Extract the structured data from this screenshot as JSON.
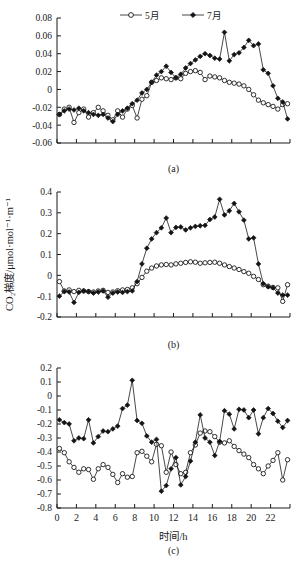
{
  "figure": {
    "xlabel": "时间/h",
    "ylabel": "CO₂梯度/μmol·mol⁻¹·m⁻¹",
    "legend": [
      {
        "label": "5月",
        "marker": "open-circle"
      },
      {
        "label": "7月",
        "marker": "filled-diamond"
      }
    ],
    "panel_labels": [
      "(a)",
      "(b)",
      "(c)"
    ]
  },
  "chart_data": [
    {
      "type": "line",
      "panel": "(a)",
      "title": "",
      "xlabel": "",
      "ylabel": "",
      "xlim": [
        0,
        24
      ],
      "ylim": [
        -0.06,
        0.08
      ],
      "yticks": [
        0.08,
        0.06,
        0.04,
        0.02,
        0,
        -0.02,
        -0.04,
        -0.06
      ],
      "ytick_labels": [
        "0.08",
        "0.06",
        "0.04",
        "0.02",
        "0",
        "-0.02",
        "-0.04",
        "-0.06"
      ],
      "xticks": [
        0,
        2,
        4,
        6,
        8,
        10,
        12,
        14,
        16,
        18,
        20,
        22
      ],
      "xtick_labels": [],
      "grid": false,
      "legend_position": "top-center",
      "x": [
        0.25,
        0.75,
        1.25,
        1.75,
        2.25,
        2.75,
        3.25,
        3.75,
        4.25,
        4.75,
        5.25,
        5.75,
        6.25,
        6.75,
        7.25,
        7.75,
        8.25,
        8.75,
        9.25,
        9.75,
        10.25,
        10.75,
        11.25,
        11.75,
        12.25,
        12.75,
        13.25,
        13.75,
        14.25,
        14.75,
        15.25,
        15.75,
        16.25,
        16.75,
        17.25,
        17.75,
        18.25,
        18.75,
        19.25,
        19.75,
        20.25,
        20.75,
        21.25,
        21.75,
        22.25,
        22.75,
        23.25,
        23.75
      ],
      "series": [
        {
          "name": "5月",
          "marker": "open-circle",
          "values": [
            -0.028,
            -0.022,
            -0.02,
            -0.037,
            -0.026,
            -0.022,
            -0.031,
            -0.026,
            -0.02,
            -0.024,
            -0.029,
            -0.034,
            -0.024,
            -0.031,
            -0.022,
            -0.018,
            -0.032,
            -0.011,
            -0.007,
            0.008,
            0.01,
            0.013,
            0.012,
            0.011,
            0.013,
            0.012,
            0.018,
            0.02,
            0.021,
            0.019,
            0.011,
            0.015,
            0.014,
            0.013,
            0.01,
            0.008,
            0.007,
            0.006,
            0.004,
            0.0,
            -0.006,
            -0.012,
            -0.015,
            -0.017,
            -0.019,
            -0.022,
            -0.017,
            -0.016
          ]
        },
        {
          "name": "7月",
          "marker": "filled-diamond",
          "values": [
            -0.028,
            -0.024,
            -0.022,
            -0.023,
            -0.021,
            -0.024,
            -0.026,
            -0.028,
            -0.029,
            -0.028,
            -0.032,
            -0.036,
            -0.028,
            -0.024,
            -0.021,
            -0.016,
            -0.012,
            -0.004,
            0.0,
            0.008,
            0.016,
            0.02,
            0.026,
            0.019,
            0.013,
            0.017,
            0.024,
            0.029,
            0.033,
            0.037,
            0.04,
            0.038,
            0.035,
            0.034,
            0.064,
            0.032,
            0.039,
            0.041,
            0.047,
            0.055,
            0.049,
            0.051,
            0.022,
            0.018,
            0.004,
            -0.01,
            -0.014,
            -0.033
          ]
        }
      ]
    },
    {
      "type": "line",
      "panel": "(b)",
      "title": "",
      "xlabel": "",
      "ylabel": "CO₂梯度/μmol·mol⁻¹·m⁻¹",
      "xlim": [
        0,
        24
      ],
      "ylim": [
        -0.2,
        0.4
      ],
      "yticks": [
        0.4,
        0.3,
        0.2,
        0.1,
        0,
        -0.1,
        -0.2
      ],
      "ytick_labels": [
        "0.4",
        "0.3",
        "0.2",
        "0.1",
        "0",
        "-0.1",
        "-0.2"
      ],
      "xticks": [
        0,
        2,
        4,
        6,
        8,
        10,
        12,
        14,
        16,
        18,
        20,
        22
      ],
      "xtick_labels": [],
      "grid": false,
      "x": [
        0.25,
        0.75,
        1.25,
        1.75,
        2.25,
        2.75,
        3.25,
        3.75,
        4.25,
        4.75,
        5.25,
        5.75,
        6.25,
        6.75,
        7.25,
        7.75,
        8.25,
        8.75,
        9.25,
        9.75,
        10.25,
        10.75,
        11.25,
        11.75,
        12.25,
        12.75,
        13.25,
        13.75,
        14.25,
        14.75,
        15.25,
        15.75,
        16.25,
        16.75,
        17.25,
        17.75,
        18.25,
        18.75,
        19.25,
        19.75,
        20.25,
        20.75,
        21.25,
        21.75,
        22.25,
        22.75,
        23.25,
        23.75
      ],
      "series": [
        {
          "name": "5月",
          "marker": "open-circle",
          "values": [
            -0.03,
            -0.075,
            -0.07,
            -0.078,
            -0.072,
            -0.075,
            -0.078,
            -0.08,
            -0.075,
            -0.072,
            -0.082,
            -0.08,
            -0.074,
            -0.07,
            -0.068,
            -0.06,
            -0.04,
            -0.01,
            0.02,
            0.035,
            0.045,
            0.05,
            0.052,
            0.05,
            0.055,
            0.058,
            0.062,
            0.065,
            0.063,
            0.058,
            0.06,
            0.062,
            0.063,
            0.058,
            0.05,
            0.042,
            0.035,
            0.028,
            0.018,
            0.01,
            -0.005,
            -0.02,
            -0.045,
            -0.052,
            -0.058,
            -0.06,
            -0.125,
            -0.045
          ]
        },
        {
          "name": "7月",
          "marker": "filled-diamond",
          "values": [
            -0.1,
            -0.078,
            -0.08,
            -0.13,
            -0.082,
            -0.075,
            -0.078,
            -0.085,
            -0.08,
            -0.075,
            -0.105,
            -0.085,
            -0.08,
            -0.082,
            -0.078,
            -0.075,
            -0.03,
            0.055,
            0.13,
            0.175,
            0.205,
            0.228,
            0.275,
            0.205,
            0.23,
            0.232,
            0.218,
            0.228,
            0.235,
            0.238,
            0.24,
            0.268,
            0.28,
            0.365,
            0.29,
            0.31,
            0.345,
            0.305,
            0.265,
            0.175,
            0.18,
            0.055,
            -0.04,
            -0.055,
            -0.06,
            -0.085,
            -0.095,
            -0.095
          ]
        }
      ]
    },
    {
      "type": "line",
      "panel": "(c)",
      "title": "",
      "xlabel": "时间/h",
      "ylabel": "",
      "xlim": [
        0,
        24
      ],
      "ylim": [
        -0.8,
        0.2
      ],
      "yticks": [
        0.2,
        0.1,
        0,
        -0.1,
        -0.2,
        -0.3,
        -0.4,
        -0.5,
        -0.6,
        -0.7,
        -0.8
      ],
      "ytick_labels": [
        "0.2",
        "0.1",
        "0",
        "-0.1",
        "-0.2",
        "-0.3",
        "-0.4",
        "-0.5",
        "-0.6",
        "-0.7",
        "-0.8"
      ],
      "xticks": [
        0,
        2,
        4,
        6,
        8,
        10,
        12,
        14,
        16,
        18,
        20,
        22
      ],
      "xtick_labels": [
        "0",
        "2",
        "4",
        "6",
        "8",
        "10",
        "12",
        "14",
        "16",
        "18",
        "20",
        "22"
      ],
      "grid": false,
      "x": [
        0.25,
        0.75,
        1.25,
        1.75,
        2.25,
        2.75,
        3.25,
        3.75,
        4.25,
        4.75,
        5.25,
        5.75,
        6.25,
        6.75,
        7.25,
        7.75,
        8.25,
        8.75,
        9.25,
        9.75,
        10.25,
        10.75,
        11.25,
        11.75,
        12.25,
        12.75,
        13.25,
        13.75,
        14.25,
        14.75,
        15.25,
        15.75,
        16.25,
        16.75,
        17.25,
        17.75,
        18.25,
        18.75,
        19.25,
        19.75,
        20.25,
        20.75,
        21.25,
        21.75,
        22.25,
        22.75,
        23.25,
        23.75
      ],
      "series": [
        {
          "name": "5月",
          "marker": "open-circle",
          "values": [
            -0.375,
            -0.405,
            -0.47,
            -0.51,
            -0.545,
            -0.52,
            -0.525,
            -0.595,
            -0.52,
            -0.49,
            -0.51,
            -0.56,
            -0.618,
            -0.555,
            -0.58,
            -0.575,
            -0.405,
            -0.395,
            -0.43,
            -0.47,
            -0.345,
            -0.355,
            -0.545,
            -0.4,
            -0.49,
            -0.555,
            -0.545,
            -0.405,
            -0.35,
            -0.265,
            -0.25,
            -0.255,
            -0.29,
            -0.33,
            -0.335,
            -0.32,
            -0.36,
            -0.39,
            -0.415,
            -0.44,
            -0.49,
            -0.52,
            -0.555,
            -0.5,
            -0.46,
            -0.405,
            -0.6,
            -0.455
          ]
        },
        {
          "name": "7月",
          "marker": "filled-diamond",
          "values": [
            -0.17,
            -0.19,
            -0.2,
            -0.32,
            -0.3,
            -0.305,
            -0.17,
            -0.335,
            -0.29,
            -0.25,
            -0.255,
            -0.235,
            -0.215,
            -0.09,
            -0.065,
            0.112,
            -0.175,
            -0.195,
            -0.285,
            -0.33,
            -0.31,
            -0.68,
            -0.64,
            -0.52,
            -0.44,
            -0.635,
            -0.575,
            -0.465,
            -0.33,
            -0.135,
            -0.3,
            -0.33,
            -0.425,
            -0.325,
            -0.105,
            -0.13,
            -0.235,
            -0.095,
            -0.1,
            -0.155,
            -0.1,
            -0.27,
            -0.155,
            -0.09,
            -0.125,
            -0.18,
            -0.225,
            -0.175
          ]
        }
      ]
    }
  ]
}
